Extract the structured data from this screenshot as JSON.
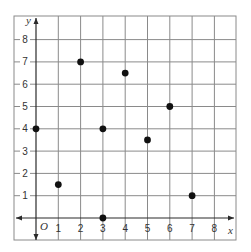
{
  "chart_data": {
    "type": "scatter",
    "title": "",
    "xlabel": "x",
    "ylabel": "y",
    "origin_label": "O",
    "xlim": [
      -1,
      9
    ],
    "ylim": [
      -1,
      9
    ],
    "x_ticks": [
      "1",
      "2",
      "3",
      "4",
      "5",
      "6",
      "7",
      "8"
    ],
    "y_ticks": [
      "1",
      "2",
      "3",
      "4",
      "5",
      "6",
      "7",
      "8"
    ],
    "grid": true,
    "legend": null,
    "points": [
      {
        "x": 0,
        "y": 4
      },
      {
        "x": 1,
        "y": 1.5
      },
      {
        "x": 2,
        "y": 7
      },
      {
        "x": 3,
        "y": 4
      },
      {
        "x": 3,
        "y": 0
      },
      {
        "x": 4,
        "y": 6.5
      },
      {
        "x": 5,
        "y": 3.5
      },
      {
        "x": 6,
        "y": 5
      },
      {
        "x": 7,
        "y": 1
      }
    ],
    "colors": {
      "point": "#111111",
      "grid": "#8a8a8a",
      "axis": "#2a2a2a"
    }
  }
}
